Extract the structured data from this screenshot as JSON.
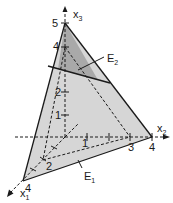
{
  "diagram": {
    "colors": {
      "background": "#ffffff",
      "plane_e1_fill": "#d6d6d6",
      "plane_e2_region_fill": "#a9a9a9",
      "line": "#1a1a1a"
    },
    "axes": {
      "x1": {
        "label": "x",
        "subscript": "1",
        "tick_labels": [
          "2",
          "4"
        ]
      },
      "x2": {
        "label": "x",
        "subscript": "2",
        "tick_labels": [
          "1",
          "3",
          "4"
        ]
      },
      "x3": {
        "label": "x",
        "subscript": "3",
        "tick_labels": [
          "1",
          "2",
          "4",
          "5"
        ]
      }
    },
    "planes": {
      "e1": {
        "label": "E",
        "subscript": "1"
      },
      "e2": {
        "label": "E",
        "subscript": "2"
      }
    }
  }
}
